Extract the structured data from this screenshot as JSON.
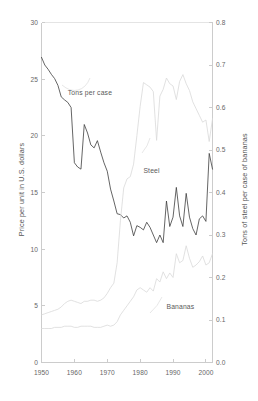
{
  "chart_data": {
    "type": "line",
    "title": "",
    "xlabel": "",
    "ylabel": "Price per unit in U.S. dollars",
    "y2label": "Tons of steel per case of bananas",
    "grid": false,
    "legend": "inline-annotations",
    "xlim": [
      1950,
      2002
    ],
    "ylim": [
      0,
      30
    ],
    "y2lim": [
      0.0,
      0.8
    ],
    "xticks": [
      "1950",
      "1960",
      "1970",
      "1980",
      "1990",
      "2000"
    ],
    "xtick_values": [
      1950,
      1960,
      1970,
      1980,
      1990,
      2000
    ],
    "yticks": [
      "0",
      "5",
      "10",
      "15",
      "20",
      "25",
      "30"
    ],
    "ytick_values": [
      0,
      5,
      10,
      15,
      20,
      25,
      30
    ],
    "y2ticks": [
      "0.0",
      "0.1",
      "0.2",
      "0.3",
      "0.4",
      "0.5",
      "0.6",
      "0.7",
      "0.8"
    ],
    "y2tick_values": [
      0.0,
      0.1,
      0.2,
      0.3,
      0.4,
      0.5,
      0.6,
      0.7,
      0.8
    ],
    "annotations": [
      {
        "text": "Tons per case",
        "x": 1958,
        "y": 23.8,
        "axis": "left"
      },
      {
        "text": "Steel",
        "x": 1981,
        "y": 16.9,
        "axis": "left"
      },
      {
        "text": "Bananas",
        "x": 1988,
        "y": 4.9,
        "axis": "left"
      }
    ],
    "series": [
      {
        "name": "Tons per case",
        "axis": "right",
        "color": "#3d3d3d",
        "units": "tons of steel per case of bananas",
        "x": [
          1950,
          1951,
          1952,
          1953,
          1954,
          1955,
          1956,
          1957,
          1958,
          1959,
          1960,
          1961,
          1962,
          1963,
          1964,
          1965,
          1966,
          1967,
          1968,
          1969,
          1970,
          1971,
          1972,
          1973,
          1974,
          1975,
          1976,
          1977,
          1978,
          1979,
          1980,
          1981,
          1982,
          1983,
          1984,
          1985,
          1986,
          1987,
          1988,
          1989,
          1990,
          1991,
          1992,
          1993,
          1994,
          1995,
          1996,
          1997,
          1998,
          1999,
          2000,
          2001,
          2002
        ],
        "values": [
          0.718,
          0.7,
          0.69,
          0.678,
          0.668,
          0.652,
          0.625,
          0.618,
          0.612,
          0.6,
          0.47,
          0.46,
          0.455,
          0.56,
          0.54,
          0.512,
          0.505,
          0.522,
          0.495,
          0.47,
          0.45,
          0.408,
          0.38,
          0.35,
          0.348,
          0.34,
          0.345,
          0.33,
          0.298,
          0.322,
          0.318,
          0.312,
          0.33,
          0.318,
          0.3,
          0.282,
          0.3,
          0.282,
          0.38,
          0.32,
          0.342,
          0.412,
          0.345,
          0.32,
          0.398,
          0.342,
          0.315,
          0.3,
          0.338,
          0.345,
          0.332,
          0.492,
          0.455
        ]
      },
      {
        "name": "Steel",
        "axis": "left",
        "color": "#d9d9d9",
        "units": "price per unit in U.S. dollars",
        "x": [
          1950,
          1951,
          1952,
          1953,
          1954,
          1955,
          1956,
          1957,
          1958,
          1959,
          1960,
          1961,
          1962,
          1963,
          1964,
          1965,
          1966,
          1967,
          1968,
          1969,
          1970,
          1971,
          1972,
          1973,
          1974,
          1975,
          1976,
          1977,
          1978,
          1979,
          1980,
          1981,
          1982,
          1983,
          1984,
          1985,
          1986,
          1987,
          1988,
          1989,
          1990,
          1991,
          1992,
          1993,
          1994,
          1995,
          1996,
          1997,
          1998,
          1999,
          2000,
          2001,
          2002
        ],
        "values": [
          4.2,
          4.3,
          4.4,
          4.5,
          4.6,
          4.7,
          4.9,
          5.2,
          5.4,
          5.5,
          5.4,
          5.3,
          5.2,
          5.4,
          5.4,
          5.5,
          5.5,
          5.4,
          5.5,
          5.7,
          6.1,
          6.6,
          7.0,
          8.8,
          12.5,
          15.4,
          16.2,
          16.4,
          17.5,
          20.0,
          22.6,
          24.7,
          24.5,
          24.3,
          23.9,
          19.6,
          23.5,
          24.1,
          25.1,
          24.6,
          24.4,
          23.2,
          24.8,
          25.4,
          24.6,
          24.0,
          23.0,
          22.4,
          21.8,
          21.2,
          21.4,
          19.5,
          21.5
        ]
      },
      {
        "name": "Bananas",
        "axis": "left",
        "color": "#d9d9d9",
        "units": "price per unit in U.S. dollars",
        "x": [
          1950,
          1951,
          1952,
          1953,
          1954,
          1955,
          1956,
          1957,
          1958,
          1959,
          1960,
          1961,
          1962,
          1963,
          1964,
          1965,
          1966,
          1967,
          1968,
          1969,
          1970,
          1971,
          1972,
          1973,
          1974,
          1975,
          1976,
          1977,
          1978,
          1979,
          1980,
          1981,
          1982,
          1983,
          1984,
          1985,
          1986,
          1987,
          1988,
          1989,
          1990,
          1991,
          1992,
          1993,
          1994,
          1995,
          1996,
          1997,
          1998,
          1999,
          2000,
          2001,
          2002
        ],
        "values": [
          3.0,
          3.0,
          3.0,
          3.0,
          3.1,
          3.1,
          3.1,
          3.2,
          3.2,
          3.2,
          3.1,
          3.1,
          3.2,
          3.2,
          3.2,
          3.2,
          3.1,
          3.1,
          3.1,
          3.2,
          3.3,
          3.2,
          3.3,
          3.6,
          4.2,
          4.6,
          5.0,
          5.4,
          5.8,
          6.4,
          6.6,
          6.4,
          6.2,
          6.6,
          6.3,
          7.4,
          7.1,
          8.0,
          7.4,
          7.9,
          7.5,
          9.6,
          8.8,
          9.0,
          10.3,
          9.2,
          8.4,
          8.6,
          8.9,
          9.4,
          8.6,
          8.8,
          9.6
        ]
      }
    ]
  }
}
